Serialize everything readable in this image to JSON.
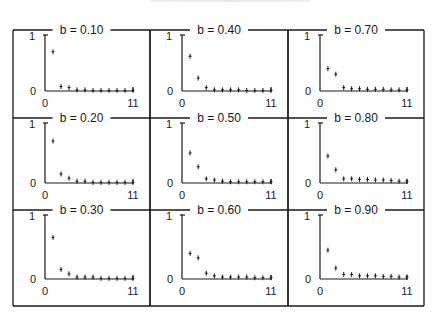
{
  "figure": {
    "frame": {
      "x": 13,
      "y": 30,
      "width": 411,
      "height": 276
    },
    "columns_x": [
      13,
      150,
      288,
      424
    ],
    "rows_y": [
      30,
      118,
      210,
      306
    ],
    "line_color": "#1a1a1a"
  },
  "chart_data": [
    {
      "type": "scatter",
      "title": "b = 0.10",
      "x": [
        1,
        2,
        3,
        4,
        5,
        6,
        7,
        8,
        9,
        10,
        11
      ],
      "values": [
        0.7,
        0.08,
        0.06,
        0.02,
        0.02,
        0.01,
        0.01,
        0.01,
        0.01,
        0.01,
        0.01
      ],
      "xlim": [
        0,
        11
      ],
      "ylim": [
        0,
        1
      ],
      "xticks": [
        "0",
        "11"
      ],
      "yticks": [
        "0",
        "1"
      ]
    },
    {
      "type": "scatter",
      "title": "b = 0.40",
      "x": [
        1,
        2,
        3,
        4,
        5,
        6,
        7,
        8,
        9,
        10,
        11
      ],
      "values": [
        0.62,
        0.23,
        0.06,
        0.02,
        0.02,
        0.02,
        0.02,
        0.01,
        0.01,
        0.01,
        0.01
      ],
      "xlim": [
        0,
        11
      ],
      "ylim": [
        0,
        1
      ],
      "xticks": [
        "0",
        "11"
      ],
      "yticks": [
        "0",
        "1"
      ]
    },
    {
      "type": "scatter",
      "title": "b = 0.70",
      "x": [
        1,
        2,
        3,
        4,
        5,
        6,
        7,
        8,
        9,
        10,
        11
      ],
      "values": [
        0.4,
        0.3,
        0.06,
        0.04,
        0.04,
        0.03,
        0.03,
        0.03,
        0.02,
        0.02,
        0.02
      ],
      "xlim": [
        0,
        11
      ],
      "ylim": [
        0,
        1
      ],
      "xticks": [
        "0",
        "11"
      ],
      "yticks": [
        "0",
        "1"
      ]
    },
    {
      "type": "scatter",
      "title": "b = 0.20",
      "x": [
        1,
        2,
        3,
        4,
        5,
        6,
        7,
        8,
        9,
        10,
        11
      ],
      "values": [
        0.7,
        0.15,
        0.08,
        0.03,
        0.03,
        0.01,
        0.01,
        0.01,
        0.01,
        0.01,
        0.01
      ],
      "xlim": [
        0,
        11
      ],
      "ylim": [
        0,
        1
      ],
      "xticks": [
        "0",
        "11"
      ],
      "yticks": [
        "0",
        "1"
      ]
    },
    {
      "type": "scatter",
      "title": "b = 0.50",
      "x": [
        1,
        2,
        3,
        4,
        5,
        6,
        7,
        8,
        9,
        10,
        11
      ],
      "values": [
        0.5,
        0.27,
        0.07,
        0.05,
        0.03,
        0.02,
        0.02,
        0.02,
        0.02,
        0.02,
        0.02
      ],
      "xlim": [
        0,
        11
      ],
      "ylim": [
        0,
        1
      ],
      "xticks": [
        "0",
        "11"
      ],
      "yticks": [
        "0",
        "1"
      ]
    },
    {
      "type": "scatter",
      "title": "b = 0.80",
      "x": [
        1,
        2,
        3,
        4,
        5,
        6,
        7,
        8,
        9,
        10,
        11
      ],
      "values": [
        0.45,
        0.22,
        0.07,
        0.07,
        0.06,
        0.06,
        0.05,
        0.05,
        0.04,
        0.03,
        0.03
      ],
      "xlim": [
        0,
        11
      ],
      "ylim": [
        0,
        1
      ],
      "xticks": [
        "0",
        "11"
      ],
      "yticks": [
        "0",
        "1"
      ]
    },
    {
      "type": "scatter",
      "title": "b = 0.30",
      "x": [
        1,
        2,
        3,
        4,
        5,
        6,
        7,
        8,
        9,
        10,
        11
      ],
      "values": [
        0.65,
        0.15,
        0.08,
        0.03,
        0.03,
        0.03,
        0.01,
        0.01,
        0.01,
        0.01,
        0.01
      ],
      "xlim": [
        0,
        11
      ],
      "ylim": [
        0,
        1
      ],
      "xticks": [
        "0",
        "11"
      ],
      "yticks": [
        "0",
        "1"
      ]
    },
    {
      "type": "scatter",
      "title": "b = 0.60",
      "x": [
        1,
        2,
        3,
        4,
        5,
        6,
        7,
        8,
        9,
        10,
        11
      ],
      "values": [
        0.4,
        0.33,
        0.09,
        0.05,
        0.03,
        0.03,
        0.03,
        0.03,
        0.02,
        0.02,
        0.02
      ],
      "xlim": [
        0,
        11
      ],
      "ylim": [
        0,
        1
      ],
      "xticks": [
        "0",
        "11"
      ],
      "yticks": [
        "0",
        "1"
      ]
    },
    {
      "type": "scatter",
      "title": "b = 0.90",
      "x": [
        1,
        2,
        3,
        4,
        5,
        6,
        7,
        8,
        9,
        10,
        11
      ],
      "values": [
        0.45,
        0.17,
        0.07,
        0.07,
        0.05,
        0.05,
        0.05,
        0.04,
        0.04,
        0.03,
        0.03
      ],
      "xlim": [
        0,
        11
      ],
      "ylim": [
        0,
        1
      ],
      "xticks": [
        "0",
        "11"
      ],
      "yticks": [
        "0",
        "1"
      ]
    }
  ]
}
